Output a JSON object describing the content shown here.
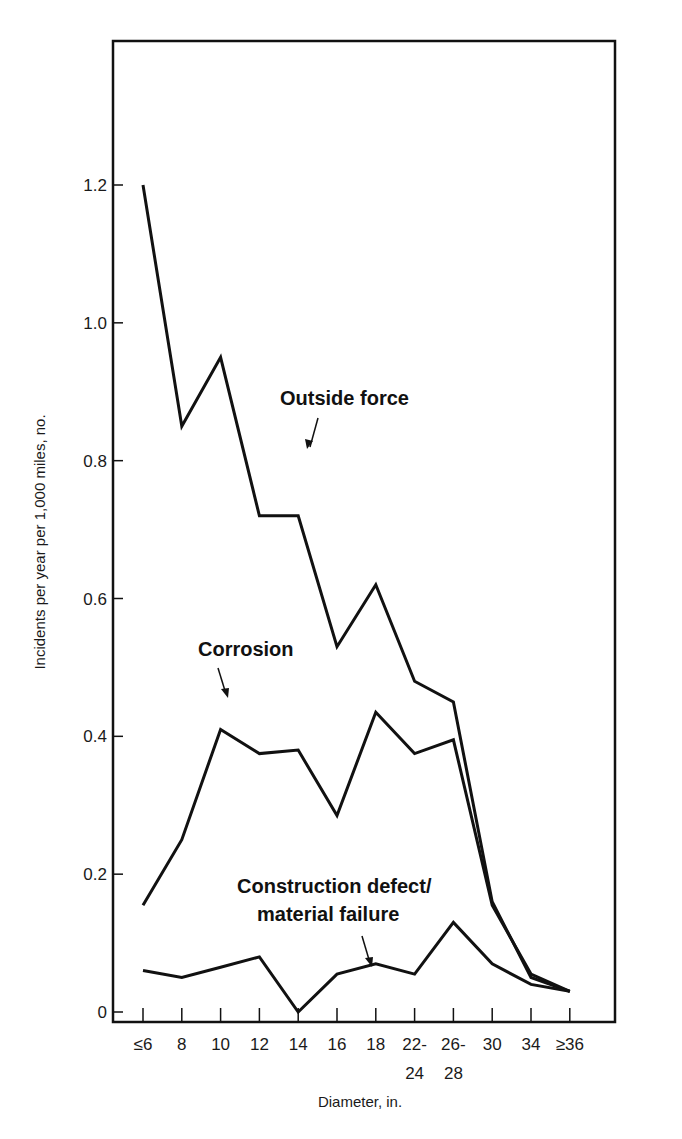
{
  "chart_data": {
    "type": "line",
    "title": "",
    "xlabel": "Diameter, in.",
    "ylabel": "Incidents per year per 1,000 miles, no.",
    "ylim": [
      0,
      1.2
    ],
    "grid": false,
    "legend": "inline annotations with arrows",
    "categories": [
      "≤6",
      "8",
      "10",
      "12",
      "14",
      "16",
      "18",
      "22-24",
      "26-28",
      "30",
      "34",
      "≥36"
    ],
    "y_ticks": [
      "0",
      "0.2",
      "0.4",
      "0.6",
      "0.8",
      "1.0",
      "1.2"
    ],
    "series": [
      {
        "name": "Outside force",
        "values": [
          1.2,
          0.85,
          0.95,
          0.72,
          0.72,
          0.53,
          0.62,
          0.48,
          0.45,
          0.16,
          0.05,
          0.03
        ]
      },
      {
        "name": "Corrosion",
        "values": [
          0.155,
          0.25,
          0.41,
          0.375,
          0.38,
          0.285,
          0.435,
          0.375,
          0.395,
          0.155,
          0.055,
          0.03
        ]
      },
      {
        "name": "Construction defect/ material failure",
        "values": [
          0.06,
          0.05,
          0.065,
          0.08,
          0.0,
          0.055,
          0.07,
          0.055,
          0.13,
          0.07,
          0.04,
          0.03
        ]
      }
    ],
    "annotations": [
      {
        "text": "Outside force",
        "points_to": "14"
      },
      {
        "text": "Corrosion",
        "points_to": "10"
      },
      {
        "text": "Construction defect/",
        "text2": "material failure",
        "points_to": "between 16 and 18"
      }
    ]
  },
  "labels": {
    "xlabel": "Diameter, in.",
    "ylabel": "Incidents per year per 1,000 miles, no.",
    "annot_outside": "Outside force",
    "annot_corrosion": "Corrosion",
    "annot_construction_1": "Construction defect/",
    "annot_construction_2": "material failure"
  }
}
